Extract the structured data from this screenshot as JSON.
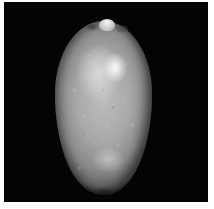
{
  "image": {
    "subject": "cowrie shell",
    "view": "dorsal",
    "color_mode": "grayscale",
    "background_color": "#040404",
    "border_color": "#ffffff"
  }
}
